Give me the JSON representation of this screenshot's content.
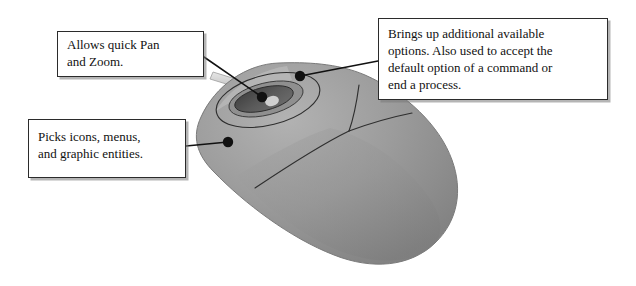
{
  "figure": {
    "device": "three-button scroll mouse",
    "body_color": "#9a9a9a",
    "body_shadow_color": "#7e7e7e",
    "wheel_color": "#4a4a4a",
    "outline_color": "#2b2b2b",
    "cable_color": "#d2d2d2",
    "background_color": "#ffffff"
  },
  "callouts": [
    {
      "id": "pan-zoom",
      "text": "Allows quick Pan\nand Zoom.",
      "target": "scroll-wheel",
      "dot": {
        "x": 262,
        "y": 97
      }
    },
    {
      "id": "pick",
      "text": "Picks icons, menus,\nand graphic entities.",
      "target": "left-button",
      "dot": {
        "x": 228,
        "y": 142
      }
    },
    {
      "id": "options",
      "text": "Brings up additional available\noptions. Also used to accept the\ndefault option of a command or\nend a process.",
      "target": "right-button",
      "dot": {
        "x": 300,
        "y": 76
      }
    }
  ],
  "parts": [
    {
      "name": "scroll-wheel",
      "label": "Allows quick Pan and Zoom."
    },
    {
      "name": "left-button",
      "label": "Picks icons, menus, and graphic entities."
    },
    {
      "name": "right-button",
      "label": "Brings up additional available options. Also used to accept the default option of a command or end a process."
    },
    {
      "name": "mouse-cable",
      "label": "Cable"
    }
  ]
}
